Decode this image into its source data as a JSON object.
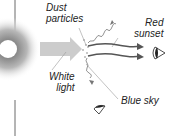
{
  "diagram": {
    "labels": {
      "dust": [
        "Dust",
        "particles"
      ],
      "red_sunset": [
        "Red",
        "sunset"
      ],
      "white_light": [
        "White",
        "light"
      ],
      "blue_sky": "Blue sky"
    },
    "colors": {
      "sun_core": "#ffffff",
      "sun_glow": "#9a9a9a",
      "beam": "#c8c8c8",
      "rays": "#555555",
      "leader": "#999999",
      "eye": "#222222"
    }
  }
}
